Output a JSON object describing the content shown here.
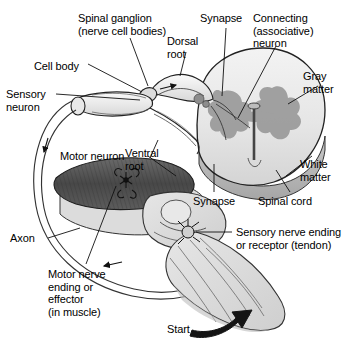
{
  "figure": {
    "type": "anatomical-diagram",
    "background_color": "#ffffff",
    "line_color": "#000000"
  },
  "palette": {
    "gray_matter": "#9a9a9a",
    "white_matter": "#e4e4e4",
    "spinal_cord_rim": "#b4b4b4",
    "muscle_dark": "#4d4d4d",
    "leg_tissue": "#dcdcdc",
    "nerve_fill": "#efefef",
    "ganglion_fill": "#dddddd",
    "arrow_black": "#111111"
  },
  "labels": [
    {
      "id": "spinal-ganglion",
      "lines": [
        "Spinal ganglion",
        "(nerve cell bodies)"
      ],
      "x": 78,
      "y": 12,
      "align": "left"
    },
    {
      "id": "cell-body",
      "lines": [
        "Cell body"
      ],
      "x": 34,
      "y": 60,
      "align": "left"
    },
    {
      "id": "sensory-neuron",
      "lines": [
        "Sensory",
        "neuron"
      ],
      "x": 6,
      "y": 88,
      "align": "left"
    },
    {
      "id": "dorsal-root",
      "lines": [
        "Dorsal",
        "root"
      ],
      "x": 167,
      "y": 35,
      "align": "left"
    },
    {
      "id": "synapse-top",
      "lines": [
        "Synapse"
      ],
      "x": 200,
      "y": 12,
      "align": "left"
    },
    {
      "id": "connecting-neuron",
      "lines": [
        "Connecting",
        "(associative)",
        "neuron"
      ],
      "x": 253,
      "y": 12,
      "align": "left"
    },
    {
      "id": "gray-matter",
      "lines": [
        "Gray",
        "matter"
      ],
      "x": 303,
      "y": 70,
      "align": "left"
    },
    {
      "id": "white-matter",
      "lines": [
        "White",
        "matter"
      ],
      "x": 300,
      "y": 158,
      "align": "left"
    },
    {
      "id": "spinal-cord",
      "lines": [
        "Spinal cord"
      ],
      "x": 258,
      "y": 195,
      "align": "left"
    },
    {
      "id": "synapse-bottom",
      "lines": [
        "Synapse"
      ],
      "x": 193,
      "y": 195,
      "align": "left"
    },
    {
      "id": "ventral-root",
      "lines": [
        "Ventral",
        "root"
      ],
      "x": 125,
      "y": 147,
      "align": "left"
    },
    {
      "id": "motor-neuron",
      "lines": [
        "Motor neuron"
      ],
      "x": 60,
      "y": 150,
      "align": "left"
    },
    {
      "id": "axon",
      "lines": [
        "Axon"
      ],
      "x": 10,
      "y": 232,
      "align": "left"
    },
    {
      "id": "motor-nerve-ending",
      "lines": [
        "Motor nerve",
        "ending or",
        "effector",
        "(in muscle)"
      ],
      "x": 48,
      "y": 268,
      "align": "left"
    },
    {
      "id": "sensory-nerve-ending",
      "lines": [
        "Sensory nerve ending",
        "or receptor (tendon)"
      ],
      "x": 236,
      "y": 226,
      "align": "left"
    },
    {
      "id": "start",
      "lines": [
        "Start"
      ],
      "x": 167,
      "y": 323,
      "align": "left"
    }
  ],
  "structures": [
    {
      "id": "spinal-cord-cross-section",
      "name": "spinal cord cross section"
    },
    {
      "id": "gray-matter-butterfly",
      "name": "butterfly shaped gray matter"
    },
    {
      "id": "white-matter-ring",
      "name": "white matter surrounding gray matter"
    },
    {
      "id": "dorsal-root-ganglion",
      "name": "dorsal root ganglion bulb"
    },
    {
      "id": "spinal-nerve-trunk",
      "name": "spinal nerve trunk"
    },
    {
      "id": "quadriceps-muscle",
      "name": "striated quadriceps muscle"
    },
    {
      "id": "knee-joint",
      "name": "knee joint with patella"
    },
    {
      "id": "lower-leg",
      "name": "lower leg"
    },
    {
      "id": "patellar-tendon-receptor",
      "name": "tendon stretch receptor"
    },
    {
      "id": "axon-loop",
      "name": "long sensory axon loop"
    },
    {
      "id": "start-arrow",
      "name": "thick black start arrow (tendon tap)"
    }
  ]
}
